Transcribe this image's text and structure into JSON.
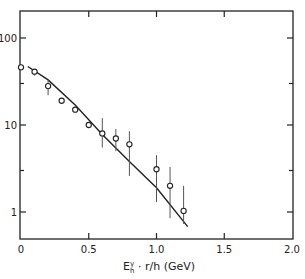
{
  "chart_data": {
    "type": "scatter",
    "title": "",
    "xlabel": "E_h^γ · r/h (GeV)",
    "xlabel_parts": {
      "base": "E",
      "sub": "h",
      "sup": "γ",
      "rest": " · r/h (GeV)"
    },
    "ylabel": "",
    "xlim": [
      0,
      2.0
    ],
    "ylim": [
      0.7,
      200
    ],
    "yscale": "log",
    "grid": false,
    "legend": null,
    "x_ticks": [
      0,
      0.5,
      1.0,
      1.5,
      2.0
    ],
    "x_tick_labels": [
      "0",
      "0.5",
      "1.0",
      "1.5",
      "2.0"
    ],
    "y_ticks": [
      1,
      10,
      100
    ],
    "y_tick_labels": [
      "1",
      "10",
      "100"
    ],
    "series": [
      {
        "name": "data",
        "style": "open-circle-with-error-bars",
        "points": [
          {
            "x": 0.0,
            "y": 46,
            "err_low": 46,
            "err_high": 46
          },
          {
            "x": 0.1,
            "y": 41,
            "err_low": 37,
            "err_high": 41
          },
          {
            "x": 0.2,
            "y": 28,
            "err_low": 22,
            "err_high": 33
          },
          {
            "x": 0.3,
            "y": 19,
            "err_low": 19,
            "err_high": 19
          },
          {
            "x": 0.4,
            "y": 15,
            "err_low": 15,
            "err_high": 15
          },
          {
            "x": 0.5,
            "y": 10,
            "err_low": 10,
            "err_high": 10
          },
          {
            "x": 0.6,
            "y": 8,
            "err_low": 5.5,
            "err_high": 12
          },
          {
            "x": 0.7,
            "y": 7,
            "err_low": 5,
            "err_high": 9
          },
          {
            "x": 0.8,
            "y": 6,
            "err_low": 2.6,
            "err_high": 8.5
          },
          {
            "x": 1.0,
            "y": 3.1,
            "err_low": 1.3,
            "err_high": 4.5
          },
          {
            "x": 1.1,
            "y": 2.0,
            "err_low": 0.85,
            "err_high": 3.3
          },
          {
            "x": 1.2,
            "y": 1.03,
            "err_low": 0.73,
            "err_high": 2.0
          }
        ]
      },
      {
        "name": "fit-curve",
        "style": "solid-line",
        "points": [
          {
            "x": 0.05,
            "y": 47
          },
          {
            "x": 0.2,
            "y": 33
          },
          {
            "x": 0.4,
            "y": 17
          },
          {
            "x": 0.6,
            "y": 7.8
          },
          {
            "x": 0.8,
            "y": 3.8
          },
          {
            "x": 1.0,
            "y": 1.9
          },
          {
            "x": 1.23,
            "y": 0.68
          }
        ]
      }
    ]
  }
}
